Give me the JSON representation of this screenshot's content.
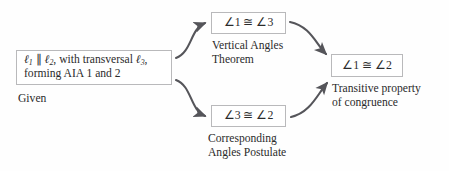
{
  "diagram": {
    "background_color": "#fefefe",
    "box_border_color": "#b9b9bb",
    "text_color": "#2b2b2b",
    "arrow_color": "#55555a"
  },
  "nodes": {
    "given": {
      "statement_line1": "ℓ₁ ∥ ℓ₂, with transversal ℓ₃,",
      "statement_line2": "forming AIA 1 and 2",
      "statement_plain": "ℓ₁ ∥ ℓ₂, with transversal ℓ₃, forming AIA 1 and 2",
      "reason": "Given"
    },
    "vertical": {
      "statement": "∠1 ≅ ∠3",
      "reason": "Vertical Angles\nTheorem"
    },
    "corresponding": {
      "statement": "∠3 ≅ ∠2",
      "reason": "Corresponding\nAngles Postulate"
    },
    "conclusion": {
      "statement": "∠1 ≅ ∠2",
      "reason": "Transitive property\nof congruence"
    }
  },
  "edges": [
    {
      "name": "given-to-vertical",
      "from": "given",
      "to": "vertical",
      "style": "curved-arrow-up-right"
    },
    {
      "name": "given-to-corresponding",
      "from": "given",
      "to": "corresponding",
      "style": "curved-arrow-down-right"
    },
    {
      "name": "vertical-to-conclusion",
      "from": "vertical",
      "to": "conclusion",
      "style": "curved-arrow-down-right"
    },
    {
      "name": "corresponding-to-conclusion",
      "from": "corresponding",
      "to": "conclusion",
      "style": "curved-arrow-up-right"
    }
  ]
}
